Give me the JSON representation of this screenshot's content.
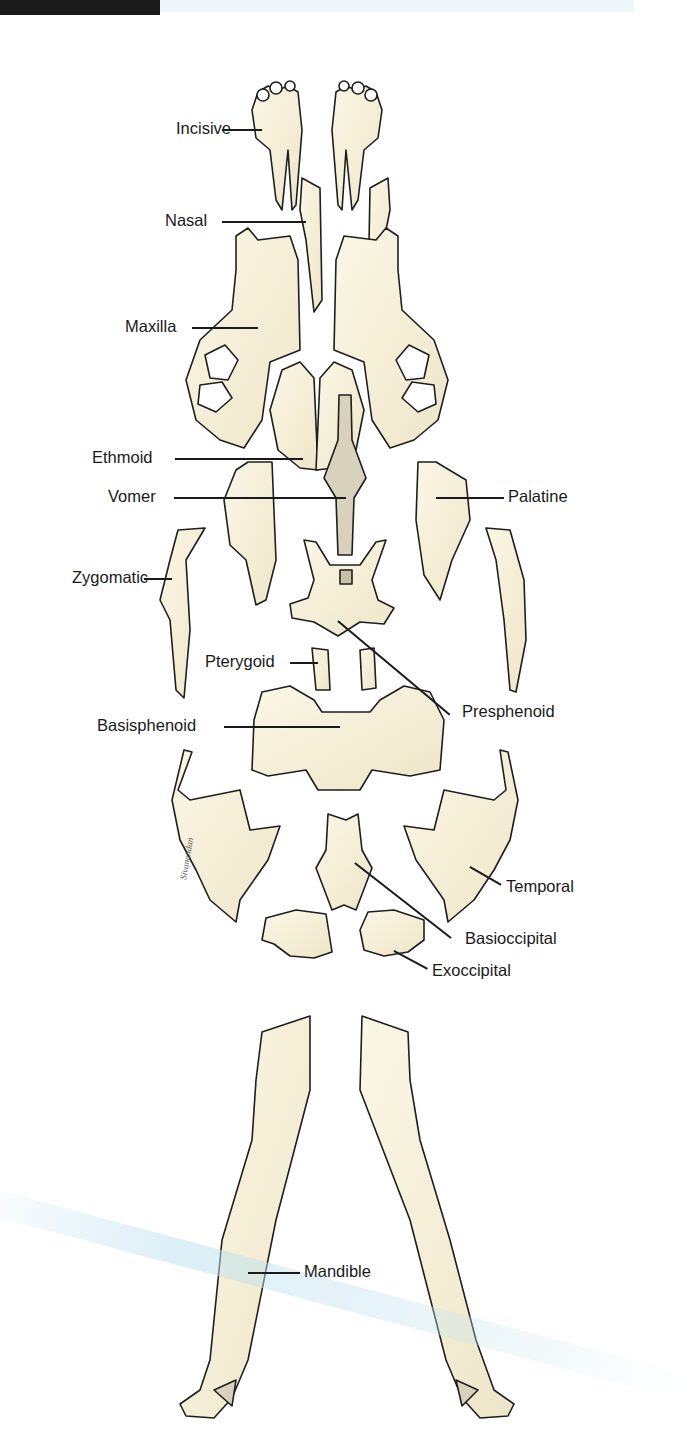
{
  "figure": {
    "colors": {
      "bone_fill": "#f6f1dc",
      "bone_outline": "#1e1e1e",
      "shading": "#8a8270",
      "label_text": "#1a1a1a",
      "background": "#ffffff"
    },
    "labels": [
      {
        "id": "incisive",
        "text": "Incisive"
      },
      {
        "id": "nasal",
        "text": "Nasal"
      },
      {
        "id": "maxilla",
        "text": "Maxilla"
      },
      {
        "id": "ethmoid",
        "text": "Ethmoid"
      },
      {
        "id": "vomer",
        "text": "Vomer"
      },
      {
        "id": "palatine",
        "text": "Palatine"
      },
      {
        "id": "zygomatic",
        "text": "Zygomatic"
      },
      {
        "id": "pterygoid",
        "text": "Pterygoid"
      },
      {
        "id": "presphenoid",
        "text": "Presphenoid"
      },
      {
        "id": "basisphenoid",
        "text": "Basisphenoid"
      },
      {
        "id": "temporal",
        "text": "Temporal"
      },
      {
        "id": "basioccipital",
        "text": "Basioccipital"
      },
      {
        "id": "exoccipital",
        "text": "Exoccipital"
      },
      {
        "id": "mandible",
        "text": "Mandible"
      }
    ],
    "artist_signature": "signature"
  }
}
